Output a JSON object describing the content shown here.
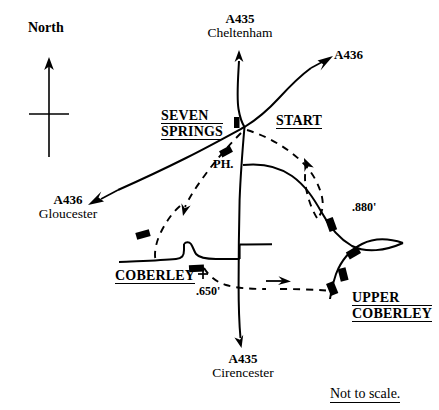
{
  "map": {
    "title": "Seven Springs / Coberley area road sketch map",
    "scale_note": "Not to scale.",
    "ink_color": "#000000",
    "background_color": "#ffffff",
    "compass": {
      "label": "North",
      "direction": "up"
    },
    "places": [
      {
        "id": "seven-springs",
        "lines": [
          "SEVEN",
          "SPRINGS"
        ],
        "underlined": true
      },
      {
        "id": "start",
        "lines": [
          "START"
        ],
        "underlined": true
      },
      {
        "id": "coberley",
        "lines": [
          "COBERLEY"
        ],
        "underlined": true
      },
      {
        "id": "upper-coberley",
        "lines": [
          "UPPER",
          "COBERLEY"
        ],
        "underlined": true
      }
    ],
    "pub": {
      "label": "PH."
    },
    "road_labels": [
      {
        "id": "a435-cheltenham",
        "number": "A435",
        "destination": "Cheltenham",
        "arrow": "up"
      },
      {
        "id": "a436-northeast",
        "number": "A436",
        "destination": "",
        "arrow": "up-right"
      },
      {
        "id": "a436-gloucester",
        "number": "A436",
        "destination": "Gloucester",
        "arrow": "down-left"
      },
      {
        "id": "a435-cirencester",
        "number": "A435",
        "destination": "Cirencester",
        "arrow": "down"
      }
    ],
    "spot_heights": [
      {
        "id": "height-880",
        "value": ".880'"
      },
      {
        "id": "height-650",
        "value": ".650'",
        "has_cross_marker": true
      }
    ]
  }
}
